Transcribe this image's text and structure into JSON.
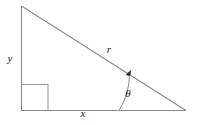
{
  "figure": {
    "type": "right-triangle-diagram",
    "background_color": "#ffffff",
    "stroke_color": "#8a8a8a",
    "label_color": "#1a1a1a",
    "stroke_width": 1,
    "vertices": {
      "apex": {
        "x": 21,
        "y": 6
      },
      "right_angle_corner": {
        "x": 21,
        "y": 110
      },
      "angle_vertex": {
        "x": 186,
        "y": 110
      }
    },
    "right_angle_marker": {
      "name": "right-angle-square",
      "x": 21,
      "y": 84,
      "size": 27
    },
    "angle_arc": {
      "name": "theta-arc",
      "center": {
        "x": 186,
        "y": 110
      },
      "radius": 67,
      "start": {
        "x": 119,
        "y": 110
      },
      "end": {
        "x": 129,
        "y": 73
      },
      "arrow_tip": {
        "x": 129,
        "y": 72
      }
    },
    "labels": {
      "vertical_leg": {
        "text": "y",
        "x": 10,
        "y": 59
      },
      "horizontal_leg": {
        "text": "x",
        "x": 83,
        "y": 114
      },
      "hypotenuse": {
        "text": "r",
        "x": 109,
        "y": 50
      },
      "angle": {
        "text": "θ",
        "x": 128,
        "y": 94
      }
    }
  }
}
